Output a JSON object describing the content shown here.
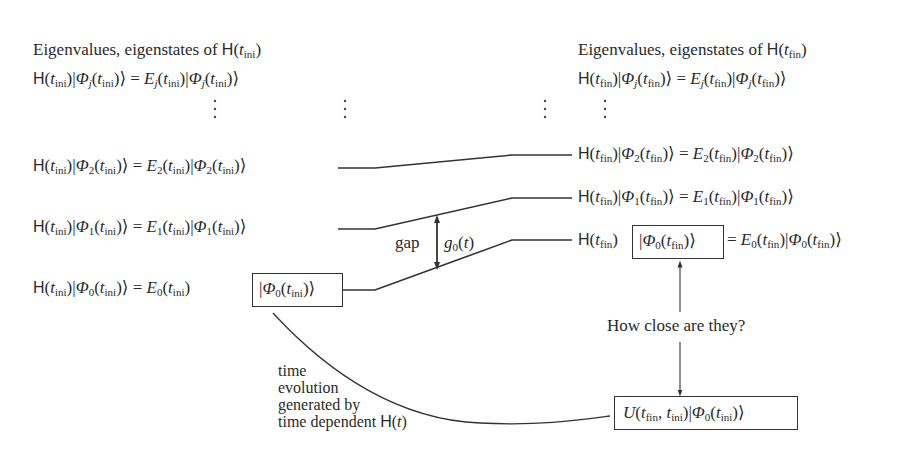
{
  "left_panel": {
    "title_prefix": "Eigenvalues, eigenstates of ",
    "title_H": "H",
    "title_t": "t",
    "title_sub": "ini",
    "general_equation": "H(t_ini)|Φ_j(t_ini)⟩ = E_j(t_ini)|Φ_j(t_ini)⟩",
    "rows": [
      {
        "index": "2",
        "equation": "H(t_ini)|Φ_2(t_ini)⟩ = E_2(t_ini)|Φ_2(t_ini)⟩"
      },
      {
        "index": "1",
        "equation": "H(t_ini)|Φ_1(t_ini)⟩ = E_1(t_ini)|Φ_1(t_ini)⟩"
      },
      {
        "index": "0",
        "equation": "H(t_ini)|Φ_0(t_ini)⟩ = E_0(t_ini) |Φ_0(t_ini)⟩",
        "boxed_part": "|Φ_0(t_ini)⟩"
      }
    ]
  },
  "right_panel": {
    "title_prefix": "Eigenvalues, eigenstates of ",
    "title_H": "H",
    "title_t": "t",
    "title_sub": "fin",
    "general_equation": "H(t_fin)|Φ_j(t_fin)⟩ = E_j(t_fin)|Φ_j(t_fin)⟩",
    "rows": [
      {
        "index": "2",
        "equation": "H(t_fin)|Φ_2(t_fin)⟩ = E_2(t_fin)|Φ_2(t_fin)⟩"
      },
      {
        "index": "1",
        "equation": "H(t_fin)|Φ_1(t_fin)⟩ = E_1(t_fin)|Φ_1(t_fin)⟩"
      },
      {
        "index": "0",
        "equation": "H(t_fin) |Φ_0(t_fin)⟩ = E_0(t_fin)|Φ_0(t_fin)⟩",
        "boxed_part": "|Φ_0(t_fin)⟩"
      }
    ]
  },
  "gap": {
    "label": "gap",
    "symbol": "g",
    "symbol_sub": "0",
    "symbol_arg": "(t)"
  },
  "comparison": {
    "question": "How close are they?"
  },
  "evolution": {
    "label_lines": [
      "time",
      "evolution",
      "generated by",
      "time dependent "
    ],
    "label_H": "H",
    "label_arg": "(t)",
    "result_state": "U(t_fin, t_ini)|Φ_0(t_ini)⟩"
  },
  "symbols": {
    "H": "H",
    "Phi": "Φ",
    "E": "E",
    "U": "U",
    "t": "t",
    "lpar": "(",
    "rpar": ")",
    "bar": "|",
    "ket": "⟩",
    "eq": " = ",
    "comma": ",",
    "j": "j",
    "ini": "ini",
    "fin": "fin",
    "vdots": "⋮"
  },
  "colors": {
    "ink": "#2a2a2a",
    "line": "#333333",
    "background": "#ffffff"
  }
}
